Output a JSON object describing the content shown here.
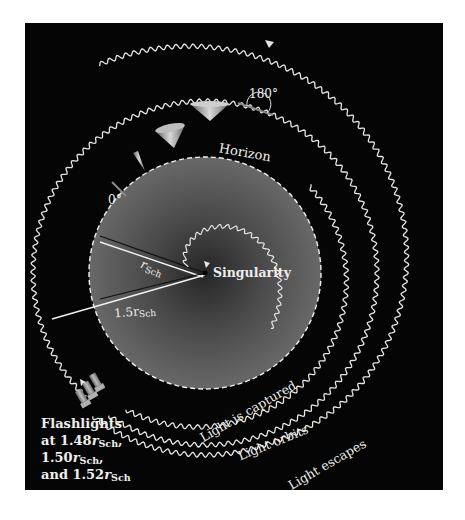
{
  "diagram": {
    "colors": {
      "background": "#050505",
      "page": "#ffffff",
      "horizon_fill_center": "#2e2e2e",
      "horizon_fill_edge": "#6a6a6a",
      "lines": "#e8e8e8",
      "cone": "#9a9a9a"
    },
    "labels": {
      "horizon": "Horizon",
      "singularity": "Singularity",
      "angle_zero": "0°",
      "angle_180": "180°",
      "r_sch": "r",
      "r_sch_sub": "Sch",
      "r_15": "1.5r",
      "r_15_sub": "Sch",
      "captured": "Light is captured",
      "orbits": "Light orbits",
      "escapes": "Light escapes"
    },
    "flashlights": {
      "line1": "Flashlights",
      "line2_prefix": "at 1.48",
      "line2_r": "r",
      "line2_sub": "Sch",
      "line2_suffix": ",",
      "line3_prefix": "1.50",
      "line3_r": "r",
      "line3_sub": "Sch",
      "line3_suffix": ",",
      "line4_prefix": "and 1.52",
      "line4_r": "r",
      "line4_sub": "Sch",
      "positions_rsch": [
        1.48,
        1.5,
        1.52
      ]
    },
    "geometry": {
      "center": [
        205,
        273
      ],
      "horizon_radius": 116,
      "photon_sphere_radius": 174
    }
  }
}
